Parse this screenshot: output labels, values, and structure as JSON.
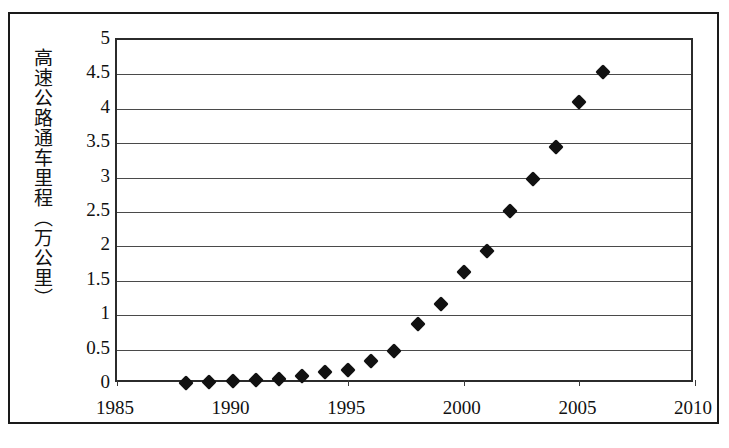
{
  "chart_data": {
    "type": "scatter",
    "title": "",
    "subtitle": "",
    "xlabel": "",
    "ylabel": "高速公路通车里程（万公里）",
    "ylabel_unit": "万公里",
    "xlim": [
      1985,
      2010
    ],
    "ylim": [
      0,
      5
    ],
    "grid": true,
    "grid_axis": "y",
    "legend": false,
    "legend_position": "none",
    "marker": "diamond",
    "marker_color": "#111111",
    "xticks": [
      1985,
      1990,
      1995,
      2000,
      2005,
      2010
    ],
    "xtick_labels": [
      "1985",
      "1990",
      "1995",
      "2000",
      "2005",
      "2010"
    ],
    "yticks": [
      0,
      0.5,
      1,
      1.5,
      2,
      2.5,
      3,
      3.5,
      4,
      4.5,
      5
    ],
    "ytick_labels": [
      "0",
      "0.5",
      "1",
      "1.5",
      "2",
      "2.5",
      "3",
      "3.5",
      "4",
      "4.5",
      "5"
    ],
    "series": [
      {
        "name": "高速公路通车里程",
        "x": [
          1988,
          1989,
          1990,
          1991,
          1992,
          1993,
          1994,
          1995,
          1996,
          1997,
          1998,
          1999,
          2000,
          2001,
          2002,
          2003,
          2004,
          2005,
          2006
        ],
        "values": [
          0.01,
          0.03,
          0.05,
          0.06,
          0.07,
          0.11,
          0.17,
          0.21,
          0.34,
          0.48,
          0.87,
          1.16,
          1.63,
          1.94,
          2.51,
          2.98,
          3.44,
          4.1,
          4.53
        ]
      }
    ],
    "points": [
      {
        "x": 1988,
        "y": 0.01
      },
      {
        "x": 1989,
        "y": 0.03
      },
      {
        "x": 1990,
        "y": 0.05
      },
      {
        "x": 1991,
        "y": 0.06
      },
      {
        "x": 1992,
        "y": 0.07
      },
      {
        "x": 1993,
        "y": 0.11
      },
      {
        "x": 1994,
        "y": 0.17
      },
      {
        "x": 1995,
        "y": 0.21
      },
      {
        "x": 1996,
        "y": 0.34
      },
      {
        "x": 1997,
        "y": 0.48
      },
      {
        "x": 1998,
        "y": 0.87
      },
      {
        "x": 1999,
        "y": 1.16
      },
      {
        "x": 2000,
        "y": 1.63
      },
      {
        "x": 2001,
        "y": 1.94
      },
      {
        "x": 2002,
        "y": 2.51
      },
      {
        "x": 2003,
        "y": 2.98
      },
      {
        "x": 2004,
        "y": 3.44
      },
      {
        "x": 2005,
        "y": 4.1
      },
      {
        "x": 2006,
        "y": 4.53
      }
    ]
  },
  "colors": {
    "marker": "#111111",
    "gridline": "#4a4a4a",
    "plot_border": "#2b2b2b",
    "frame_border": "#1a1a1a",
    "background": "#ffffff",
    "text": "#111111"
  }
}
